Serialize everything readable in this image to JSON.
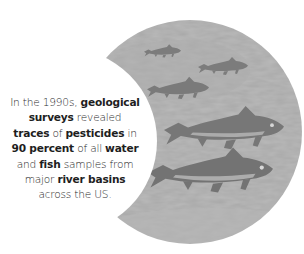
{
  "illustration": {
    "subject": "trout swimming in river water",
    "shape": "crescent",
    "fish_count": 5,
    "colors": {
      "water": "#a8a8a8",
      "water_light": "#b8b8b8",
      "fish": "#7b7b7b",
      "fish_dark": "#6d6d6d",
      "fish_highlight": "#c4c4c4",
      "background": "#ffffff"
    }
  },
  "caption": {
    "lines": [
      [
        {
          "t": "In the 1990s, ",
          "b": false
        },
        {
          "t": "geological",
          "b": true
        }
      ],
      [
        {
          "t": "surveys",
          "b": true
        },
        {
          "t": " revealed",
          "b": false
        }
      ],
      [
        {
          "t": "traces",
          "b": true
        },
        {
          "t": " of ",
          "b": false
        },
        {
          "t": "pesticides",
          "b": true
        },
        {
          "t": " in",
          "b": false
        }
      ],
      [
        {
          "t": "90 percent",
          "b": true
        },
        {
          "t": " of all ",
          "b": false
        },
        {
          "t": "water",
          "b": true
        }
      ],
      [
        {
          "t": "and ",
          "b": false
        },
        {
          "t": "fish",
          "b": true
        },
        {
          "t": " samples from",
          "b": false
        }
      ],
      [
        {
          "t": "major ",
          "b": false
        },
        {
          "t": "river basins",
          "b": true
        }
      ],
      [
        {
          "t": "across the US.",
          "b": false
        }
      ]
    ],
    "text_color": "#2a2a2a"
  }
}
